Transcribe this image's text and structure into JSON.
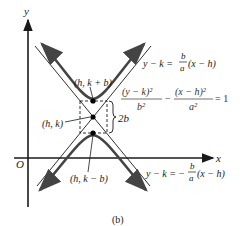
{
  "figure": {
    "caption": "(b)",
    "axes": {
      "x_label": "x",
      "y_label": "y",
      "origin_label": "O"
    },
    "points": {
      "top_vertex": "(h, k + b)",
      "center": "(h, k)",
      "bottom_vertex": "(h, k − b)"
    },
    "brace_label": "2b",
    "asymptote_upper": {
      "lhs": "y − k =",
      "num": "b",
      "den": "a",
      "rhs": "(x − h)"
    },
    "asymptote_lower": {
      "lhs": "y − k = −",
      "num": "b",
      "den": "a",
      "rhs": "(x − h)"
    },
    "equation": {
      "term1_num": "(y − k)²",
      "term1_den": "b²",
      "minus": "−",
      "term2_num": "(x − h)²",
      "term2_den": "a²",
      "rhs": "= 1"
    },
    "colors": {
      "ink": "#1a1a1a",
      "curve": "#444444",
      "background": "#ffffff"
    }
  }
}
